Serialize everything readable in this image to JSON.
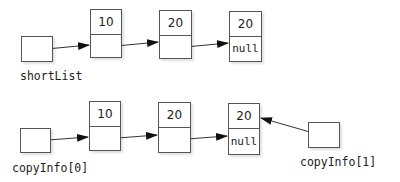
{
  "diagram": {
    "rows": [
      {
        "name": "shortList",
        "pointer_label": "shortList",
        "nodes": [
          {
            "value": "10",
            "next": ""
          },
          {
            "value": "20",
            "next": ""
          },
          {
            "value": "20",
            "next": "null"
          }
        ]
      },
      {
        "name": "copyInfo",
        "pointer_label": "copyInfo[0]",
        "second_pointer_label": "copyInfo[1]",
        "nodes": [
          {
            "value": "10",
            "next": ""
          },
          {
            "value": "20",
            "next": ""
          },
          {
            "value": "20",
            "next": "null"
          }
        ]
      }
    ],
    "colors": {
      "line": "#333333",
      "border": "#555555",
      "background": "#ffffff"
    }
  }
}
